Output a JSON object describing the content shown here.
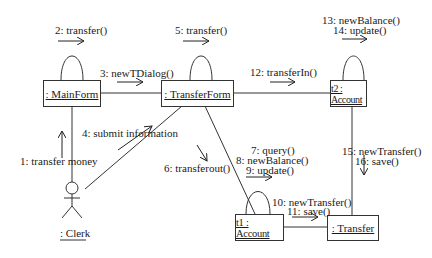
{
  "diagram": {
    "type": "UML communication diagram",
    "objects": {
      "mainform": ": MainForm",
      "transferform": ": TransferForm",
      "t2account": "t2 : Account",
      "t1account": "t1 : Account",
      "transfer": ": Transfer"
    },
    "actor": {
      "clerk": ": Clerk"
    },
    "messages": {
      "m1": "1: transfer money",
      "m2": "2: transfer()",
      "m3": "3: newTDialog()",
      "m4": "4: submit information",
      "m5": "5: transfer()",
      "m6": "6: transferout()",
      "m7": "7: query()",
      "m8": "8: newBalance()",
      "m9": "9: update()",
      "m10": "10: newTransfer()",
      "m11": "11: save()",
      "m12": "12: transferIn()",
      "m13": "13: newBalance()",
      "m14": "14: update()",
      "m15": "15: newTransfer()",
      "m16": "16: save()"
    }
  }
}
